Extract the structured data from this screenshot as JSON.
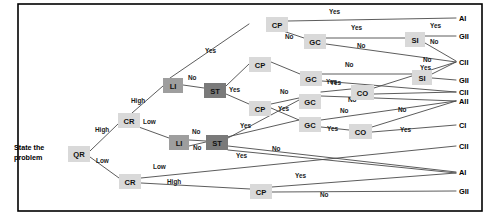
{
  "diagram": {
    "root_caption_line1": "State the",
    "root_caption_line2": "problem",
    "frame": {
      "x": 18,
      "y": 4,
      "width": 464,
      "height": 207,
      "stroke": "#000000"
    },
    "colors": {
      "node_light": "#d9d9d9",
      "node_mid": "#9e9e9e",
      "node_dark": "#7a7a7a",
      "edge": "#4a4a4a",
      "text": "#111111",
      "background": "#ffffff"
    }
  },
  "chart_data": {
    "type": "diagram",
    "node_codes": [
      "QR",
      "CR",
      "LI",
      "ST",
      "CP",
      "GC",
      "SI",
      "CO"
    ],
    "outcome_codes": [
      "AI",
      "GII",
      "CII",
      "AII",
      "CI"
    ],
    "edge_label_values": [
      "Yes",
      "No",
      "High",
      "Low"
    ]
  },
  "nodes": [
    {
      "id": "qr",
      "label": "QR",
      "x": 68,
      "y": 146,
      "w": 22,
      "h": 16,
      "shade": "light"
    },
    {
      "id": "cr1",
      "label": "CR",
      "x": 118,
      "y": 113,
      "w": 22,
      "h": 15,
      "shade": "light"
    },
    {
      "id": "cr2",
      "label": "CR",
      "x": 119,
      "y": 174,
      "w": 22,
      "h": 15,
      "shade": "light"
    },
    {
      "id": "li1",
      "label": "LI",
      "x": 163,
      "y": 78,
      "w": 20,
      "h": 15,
      "shade": "mid"
    },
    {
      "id": "st1",
      "label": "ST",
      "x": 204,
      "y": 83,
      "w": 22,
      "h": 15,
      "shade": "dark"
    },
    {
      "id": "li2",
      "label": "LI",
      "x": 169,
      "y": 135,
      "w": 20,
      "h": 15,
      "shade": "mid"
    },
    {
      "id": "st2",
      "label": "ST",
      "x": 206,
      "y": 135,
      "w": 22,
      "h": 15,
      "shade": "dark"
    },
    {
      "id": "cp1",
      "label": "CP",
      "x": 266,
      "y": 17,
      "w": 22,
      "h": 15,
      "shade": "light"
    },
    {
      "id": "gc1",
      "label": "GC",
      "x": 304,
      "y": 34,
      "w": 22,
      "h": 15,
      "shade": "light"
    },
    {
      "id": "si1",
      "label": "SI",
      "x": 405,
      "y": 32,
      "w": 20,
      "h": 15,
      "shade": "light"
    },
    {
      "id": "cp2",
      "label": "CP",
      "x": 249,
      "y": 57,
      "w": 22,
      "h": 15,
      "shade": "light"
    },
    {
      "id": "gc2",
      "label": "GC",
      "x": 300,
      "y": 71,
      "w": 22,
      "h": 15,
      "shade": "light"
    },
    {
      "id": "si2",
      "label": "SI",
      "x": 412,
      "y": 70,
      "w": 20,
      "h": 15,
      "shade": "light"
    },
    {
      "id": "co1",
      "label": "CO",
      "x": 351,
      "y": 85,
      "w": 23,
      "h": 15,
      "shade": "light"
    },
    {
      "id": "cp3",
      "label": "CP",
      "x": 249,
      "y": 101,
      "w": 22,
      "h": 15,
      "shade": "light"
    },
    {
      "id": "gc3",
      "label": "GC",
      "x": 299,
      "y": 94,
      "w": 22,
      "h": 15,
      "shade": "light"
    },
    {
      "id": "gc4",
      "label": "GC",
      "x": 299,
      "y": 117,
      "w": 22,
      "h": 15,
      "shade": "light"
    },
    {
      "id": "co2",
      "label": "CO",
      "x": 349,
      "y": 124,
      "w": 23,
      "h": 15,
      "shade": "light"
    },
    {
      "id": "cp4",
      "label": "CP",
      "x": 250,
      "y": 184,
      "w": 22,
      "h": 15,
      "shade": "light"
    }
  ],
  "outcomes": [
    {
      "id": "o1",
      "label": "AI",
      "x": 459,
      "y": 18
    },
    {
      "id": "o2",
      "label": "GII",
      "x": 459,
      "y": 36
    },
    {
      "id": "o3",
      "label": "CII",
      "x": 459,
      "y": 62
    },
    {
      "id": "o4",
      "label": "GII",
      "x": 459,
      "y": 80
    },
    {
      "id": "o5",
      "label": "CII",
      "x": 459,
      "y": 92
    },
    {
      "id": "o6",
      "label": "AII",
      "x": 459,
      "y": 101
    },
    {
      "id": "o7",
      "label": "CI",
      "x": 459,
      "y": 125
    },
    {
      "id": "o8",
      "label": "CII",
      "x": 459,
      "y": 146
    },
    {
      "id": "o9",
      "label": "AI",
      "x": 459,
      "y": 172
    },
    {
      "id": "o10",
      "label": "GII",
      "x": 459,
      "y": 191
    }
  ],
  "edges": [
    {
      "id": "e1",
      "x1": 90,
      "y1": 151,
      "x2": 118,
      "y2": 124,
      "label": "High",
      "lx": 95,
      "ly": 132
    },
    {
      "id": "e2",
      "x1": 90,
      "y1": 157,
      "x2": 119,
      "y2": 178,
      "label": "Low",
      "lx": 96,
      "ly": 163
    },
    {
      "id": "e3",
      "x1": 132,
      "y1": 113,
      "x2": 163,
      "y2": 86,
      "label": "High",
      "lx": 131,
      "ly": 103
    },
    {
      "id": "e4",
      "x1": 136,
      "y1": 126,
      "x2": 169,
      "y2": 138,
      "label": "Low",
      "lx": 143,
      "ly": 124
    },
    {
      "id": "e5",
      "x1": 183,
      "y1": 85,
      "x2": 204,
      "y2": 88,
      "label": "No",
      "lx": 188,
      "ly": 80
    },
    {
      "id": "e6",
      "x1": 170,
      "y1": 78,
      "x2": 249,
      "y2": 24,
      "label": "Yes",
      "lx": 205,
      "ly": 53
    },
    {
      "id": "e7",
      "x1": 226,
      "y1": 86,
      "x2": 249,
      "y2": 64,
      "label": "",
      "lx": 0,
      "ly": 0
    },
    {
      "id": "e8",
      "x1": 226,
      "y1": 94,
      "x2": 249,
      "y2": 104,
      "label": "Yes",
      "lx": 229,
      "ly": 92
    },
    {
      "id": "e9",
      "x1": 189,
      "y1": 140,
      "x2": 206,
      "y2": 141,
      "label": "No",
      "lx": 192,
      "ly": 134
    },
    {
      "id": "e10",
      "x1": 189,
      "y1": 146,
      "x2": 299,
      "y2": 120,
      "label": "No",
      "lx": 193,
      "ly": 150
    },
    {
      "id": "e11",
      "x1": 228,
      "y1": 138,
      "x2": 299,
      "y2": 100,
      "label": "Yes",
      "lx": 240,
      "ly": 128
    },
    {
      "id": "e12",
      "x1": 228,
      "y1": 146,
      "x2": 456,
      "y2": 172,
      "label": "No",
      "lx": 272,
      "ly": 151
    },
    {
      "id": "e13",
      "x1": 228,
      "y1": 150,
      "x2": 456,
      "y2": 173,
      "label": "Yes",
      "lx": 236,
      "ly": 158
    },
    {
      "id": "e14",
      "x1": 141,
      "y1": 178,
      "x2": 456,
      "y2": 146,
      "label": "Low",
      "lx": 153,
      "ly": 169
    },
    {
      "id": "e15",
      "x1": 141,
      "y1": 183,
      "x2": 250,
      "y2": 189,
      "label": "High",
      "lx": 167,
      "ly": 184
    },
    {
      "id": "e16",
      "x1": 272,
      "y1": 187,
      "x2": 456,
      "y2": 173,
      "label": "Yes",
      "lx": 295,
      "ly": 178
    },
    {
      "id": "e17",
      "x1": 272,
      "y1": 192,
      "x2": 456,
      "y2": 191,
      "label": "No",
      "lx": 320,
      "ly": 197
    },
    {
      "id": "e18",
      "x1": 288,
      "y1": 21,
      "x2": 456,
      "y2": 18,
      "label": "Yes",
      "lx": 329,
      "ly": 14
    },
    {
      "id": "e19",
      "x1": 280,
      "y1": 30,
      "x2": 304,
      "y2": 38,
      "label": "No",
      "lx": 285,
      "ly": 39
    },
    {
      "id": "e20",
      "x1": 326,
      "y1": 38,
      "x2": 405,
      "y2": 38,
      "label": "Yes",
      "lx": 351,
      "ly": 30
    },
    {
      "id": "e21",
      "x1": 326,
      "y1": 44,
      "x2": 456,
      "y2": 62,
      "label": "No",
      "lx": 357,
      "ly": 48
    },
    {
      "id": "e22",
      "x1": 425,
      "y1": 36,
      "x2": 456,
      "y2": 36,
      "label": "Yes",
      "lx": 430,
      "ly": 28
    },
    {
      "id": "e23",
      "x1": 425,
      "y1": 43,
      "x2": 456,
      "y2": 61,
      "label": "No",
      "lx": 430,
      "ly": 44
    },
    {
      "id": "e24",
      "x1": 271,
      "y1": 62,
      "x2": 300,
      "y2": 74,
      "label": "",
      "lx": 0,
      "ly": 0
    },
    {
      "id": "e25",
      "x1": 322,
      "y1": 74,
      "x2": 412,
      "y2": 74,
      "label": "No",
      "lx": 345,
      "ly": 67
    },
    {
      "id": "e26",
      "x1": 322,
      "y1": 81,
      "x2": 456,
      "y2": 92,
      "label": "Yes",
      "lx": 330,
      "ly": 85
    },
    {
      "id": "e27",
      "x1": 432,
      "y1": 74,
      "x2": 456,
      "y2": 62,
      "label": "No",
      "lx": 423,
      "ly": 62
    },
    {
      "id": "e28",
      "x1": 432,
      "y1": 78,
      "x2": 456,
      "y2": 80,
      "label": "Yes",
      "lx": 420,
      "ly": 70
    },
    {
      "id": "e29",
      "x1": 271,
      "y1": 104,
      "x2": 299,
      "y2": 98,
      "label": "No",
      "lx": 280,
      "ly": 94
    },
    {
      "id": "e30",
      "x1": 271,
      "y1": 108,
      "x2": 299,
      "y2": 120,
      "label": "Yes",
      "lx": 278,
      "ly": 111
    },
    {
      "id": "e31",
      "x1": 321,
      "y1": 96,
      "x2": 456,
      "y2": 101,
      "label": "No",
      "lx": 348,
      "ly": 102
    },
    {
      "id": "e32",
      "x1": 321,
      "y1": 92,
      "x2": 351,
      "y2": 89,
      "label": "Yes",
      "lx": 326,
      "ly": 84
    },
    {
      "id": "e33",
      "x1": 374,
      "y1": 88,
      "x2": 456,
      "y2": 62,
      "label": "",
      "lx": 0,
      "ly": 0
    },
    {
      "id": "e34",
      "x1": 374,
      "y1": 94,
      "x2": 456,
      "y2": 92,
      "label": "",
      "lx": 0,
      "ly": 0
    },
    {
      "id": "e35",
      "x1": 321,
      "y1": 120,
      "x2": 456,
      "y2": 101,
      "label": "No",
      "lx": 340,
      "ly": 113
    },
    {
      "id": "e36",
      "x1": 321,
      "y1": 127,
      "x2": 349,
      "y2": 130,
      "label": "Yes",
      "lx": 327,
      "ly": 131
    },
    {
      "id": "e37",
      "x1": 372,
      "y1": 127,
      "x2": 456,
      "y2": 101,
      "label": "No",
      "lx": 398,
      "ly": 112
    },
    {
      "id": "e38",
      "x1": 372,
      "y1": 132,
      "x2": 456,
      "y2": 125,
      "label": "Yes",
      "lx": 400,
      "ly": 132
    }
  ]
}
